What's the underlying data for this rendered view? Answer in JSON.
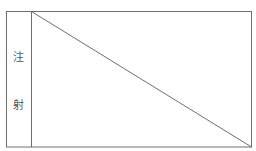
{
  "diagram": {
    "label_chars": [
      "注",
      "射"
    ],
    "stroke_color": "#6e6e6e",
    "text_color": "#555555"
  }
}
